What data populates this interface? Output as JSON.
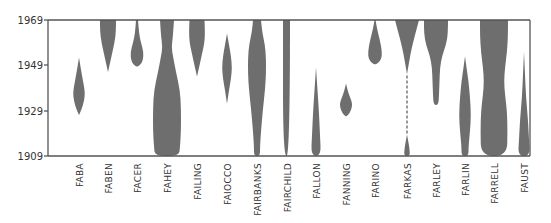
{
  "chart_data": {
    "type": "area",
    "subtype": "violin-frequency-over-time",
    "title": "",
    "xlabel": "",
    "ylabel": "",
    "ylim": [
      1909,
      1969
    ],
    "yticks": [
      1909,
      1929,
      1949,
      1969
    ],
    "ytick_labels": [
      "1909",
      "1929",
      "1949",
      "1969"
    ],
    "grid": false,
    "legend": null,
    "fill_color": "#6e6e6e",
    "categories": [
      "FABA",
      "FABEN",
      "FACER",
      "FAHEY",
      "FAILING",
      "FAIOCCO",
      "FAIRBANKS",
      "FAIRCHILD",
      "FALLON",
      "FANNING",
      "FARINO",
      "FARKAS",
      "FARLEY",
      "FARLIN",
      "FARRELL",
      "FAUST"
    ],
    "series": [
      {
        "name": "FABA",
        "x": 79,
        "profile": [
          [
            1952.5,
            0
          ],
          [
            1947,
            2
          ],
          [
            1941,
            4.5
          ],
          [
            1937,
            6
          ],
          [
            1933,
            5
          ],
          [
            1929.5,
            2.5
          ],
          [
            1927,
            0
          ]
        ]
      },
      {
        "name": "FABEN",
        "x": 108,
        "profile": [
          [
            1969,
            8
          ],
          [
            1964,
            8
          ],
          [
            1959,
            6.5
          ],
          [
            1954,
            4
          ],
          [
            1950,
            2
          ],
          [
            1946,
            0
          ]
        ]
      },
      {
        "name": "FACER",
        "x": 137,
        "profile": [
          [
            1969,
            1
          ],
          [
            1963,
            2
          ],
          [
            1959,
            4
          ],
          [
            1955,
            6.5
          ],
          [
            1951,
            6
          ],
          [
            1949,
            3
          ],
          [
            1948.5,
            0
          ]
        ]
      },
      {
        "name": "FAHEY",
        "x": 167,
        "profile": [
          [
            1969,
            7
          ],
          [
            1962,
            6
          ],
          [
            1957,
            4.5
          ],
          [
            1953,
            6
          ],
          [
            1946,
            9
          ],
          [
            1938,
            13
          ],
          [
            1930,
            14
          ],
          [
            1920,
            14
          ],
          [
            1913,
            13
          ],
          [
            1909,
            12
          ]
        ]
      },
      {
        "name": "FAILING",
        "x": 197,
        "profile": [
          [
            1969,
            7.5
          ],
          [
            1964,
            8
          ],
          [
            1959,
            7.5
          ],
          [
            1954,
            5
          ],
          [
            1949,
            2.5
          ],
          [
            1945,
            0.5
          ],
          [
            1944,
            0
          ]
        ]
      },
      {
        "name": "FAIOCCO",
        "x": 227,
        "profile": [
          [
            1963,
            0
          ],
          [
            1958,
            2
          ],
          [
            1953,
            4
          ],
          [
            1948,
            5
          ],
          [
            1943,
            4
          ],
          [
            1938,
            2
          ],
          [
            1932,
            0
          ]
        ]
      },
      {
        "name": "FAIRBANKS",
        "x": 257,
        "profile": [
          [
            1969,
            4
          ],
          [
            1964,
            5
          ],
          [
            1958,
            8
          ],
          [
            1952,
            9
          ],
          [
            1945,
            9
          ],
          [
            1938,
            8
          ],
          [
            1930,
            6
          ],
          [
            1920,
            4
          ],
          [
            1913,
            3
          ],
          [
            1909,
            3
          ]
        ]
      },
      {
        "name": "FAIRCHILD",
        "x": 286.5,
        "profile": [
          [
            1969,
            3.5
          ],
          [
            1909,
            3.5
          ]
        ]
      },
      {
        "name": "FALLON",
        "x": 316,
        "profile": [
          [
            1948,
            0
          ],
          [
            1938,
            1.5
          ],
          [
            1928,
            3
          ],
          [
            1918,
            4
          ],
          [
            1909,
            5
          ]
        ]
      },
      {
        "name": "FANNING",
        "x": 346,
        "profile": [
          [
            1941,
            0
          ],
          [
            1938,
            1.5
          ],
          [
            1935,
            4
          ],
          [
            1932,
            6.5
          ],
          [
            1929,
            5
          ],
          [
            1927,
            2
          ],
          [
            1926.5,
            0
          ]
        ]
      },
      {
        "name": "FARINO",
        "x": 375,
        "profile": [
          [
            1969,
            0.5
          ],
          [
            1965,
            2
          ],
          [
            1960,
            5
          ],
          [
            1955,
            7
          ],
          [
            1952,
            6.5
          ],
          [
            1950,
            3.5
          ],
          [
            1949.5,
            0
          ]
        ]
      },
      {
        "name": "FARKAS",
        "x": 407,
        "profile": [
          [
            1969,
            12
          ],
          [
            1964,
            9
          ],
          [
            1959,
            6
          ],
          [
            1954,
            3.5
          ],
          [
            1949,
            1.5
          ],
          [
            1945,
            0
          ],
          [
            1944.5,
            0
          ]
        ],
        "dashed_gap": [
          1944.5,
          1918.5
        ],
        "profile_lower": [
          [
            1918.5,
            0
          ],
          [
            1915,
            1.5
          ],
          [
            1912,
            2.5
          ],
          [
            1909,
            3
          ]
        ]
      },
      {
        "name": "FARLEY",
        "x": 436,
        "profile": [
          [
            1969,
            12
          ],
          [
            1963,
            12
          ],
          [
            1958,
            10
          ],
          [
            1953,
            6
          ],
          [
            1948,
            4
          ],
          [
            1942,
            3.5
          ],
          [
            1936,
            3
          ],
          [
            1932,
            2.5
          ],
          [
            1931.5,
            0
          ]
        ]
      },
      {
        "name": "FARLIN",
        "x": 465,
        "profile": [
          [
            1953,
            0
          ],
          [
            1948,
            1.5
          ],
          [
            1942,
            3.5
          ],
          [
            1935,
            5
          ],
          [
            1927,
            6
          ],
          [
            1920,
            5
          ],
          [
            1913,
            3.5
          ],
          [
            1909,
            3.5
          ]
        ]
      },
      {
        "name": "FARRELL",
        "x": 494,
        "profile": [
          [
            1969,
            14
          ],
          [
            1962,
            14
          ],
          [
            1955,
            13
          ],
          [
            1948,
            11
          ],
          [
            1942,
            10
          ],
          [
            1936,
            11
          ],
          [
            1929,
            13
          ],
          [
            1920,
            13.5
          ],
          [
            1909,
            13
          ]
        ]
      },
      {
        "name": "FAUST",
        "x": 524,
        "profile": [
          [
            1955,
            0
          ],
          [
            1945,
            1
          ],
          [
            1935,
            2
          ],
          [
            1925,
            4
          ],
          [
            1916,
            5
          ],
          [
            1909,
            6
          ]
        ]
      }
    ]
  },
  "axes": {
    "y_labels": [
      "1969",
      "1949",
      "1929",
      "1909"
    ]
  }
}
